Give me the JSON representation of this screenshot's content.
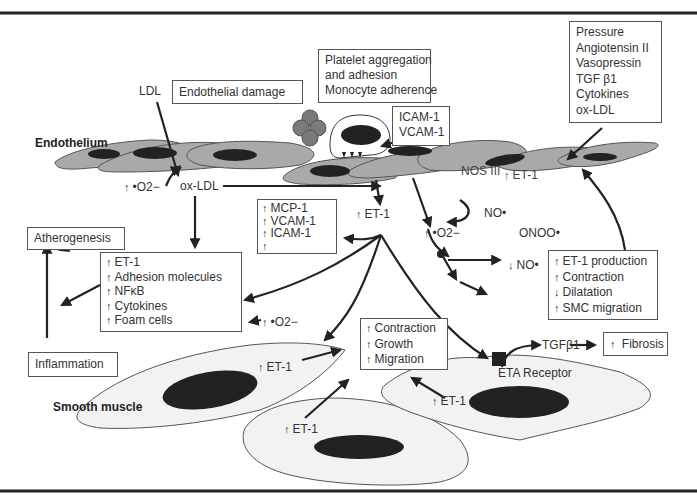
{
  "diagram": {
    "regions": {
      "endothelium_label": "Endothelium",
      "smooth_muscle_label": "Smooth muscle"
    },
    "top_labels": {
      "ldl": "LDL",
      "endothelial_damage": "Endothelial damage",
      "platelet_box": [
        "Platelet aggregation",
        "and adhesion",
        "Monocyte adherence"
      ],
      "icam_box": [
        "ICAM-1",
        "VCAM-1"
      ],
      "stimuli_box": [
        "Pressure",
        "Angiotensin II",
        "Vasopressin",
        "TGF β1",
        "Cytokines",
        "ox-LDL"
      ]
    },
    "mid_labels": {
      "superoxide_left": "•O2−",
      "ox_ldl": "ox-LDL",
      "nos3": "NOS III",
      "et1_endo": "ET-1",
      "et1_center": "ET-1",
      "no_radical": "NO•",
      "superoxide_mid": "•O2−",
      "peroxynitrite": "ONOO•",
      "no_decreased": "NO•",
      "superoxide_lower": "•O2−"
    },
    "adhesion_box": {
      "items": [
        {
          "dir": "up",
          "text": "MCP-1"
        },
        {
          "dir": "up",
          "text": "VCAM-1"
        },
        {
          "dir": "up",
          "text": "ICAM-1"
        },
        {
          "dir": "up",
          "text": ""
        }
      ]
    },
    "effects_box": {
      "items": [
        {
          "dir": "up",
          "text": "ET-1"
        },
        {
          "dir": "up",
          "text": "Adhesion molecules"
        },
        {
          "dir": "up",
          "text": "NFκB"
        },
        {
          "dir": "up",
          "text": "Cytokines"
        },
        {
          "dir": "up",
          "text": "Foam cells"
        }
      ]
    },
    "outcome_boxes": {
      "atherogenesis": "Atherogenesis",
      "inflammation": "Inflammation",
      "fibrosis": "Fibrosis"
    },
    "et1_effects_box": {
      "items": [
        {
          "dir": "up",
          "text": "ET-1 production"
        },
        {
          "dir": "up",
          "text": "Contraction"
        },
        {
          "dir": "down",
          "text": "Dilatation"
        },
        {
          "dir": "up",
          "text": "SMC migration"
        }
      ]
    },
    "smc_response_box": {
      "items": [
        {
          "dir": "up",
          "text": "Contraction"
        },
        {
          "dir": "up",
          "text": "Growth"
        },
        {
          "dir": "up",
          "text": "Migration"
        }
      ]
    },
    "smc_labels": {
      "et1_a": "ET-1",
      "et1_b": "ET-1",
      "et1_c": "ET-1",
      "tgf": "TGFβ1",
      "eta_receptor": "ETA Receptor"
    },
    "colors": {
      "endothelial_cell": "#a9a9a9",
      "nucleus": "#222222",
      "smc_cell": "#f2f2f2",
      "platelet": "#7a7a7a",
      "arrow": "#222222",
      "rule": "#222222"
    }
  }
}
